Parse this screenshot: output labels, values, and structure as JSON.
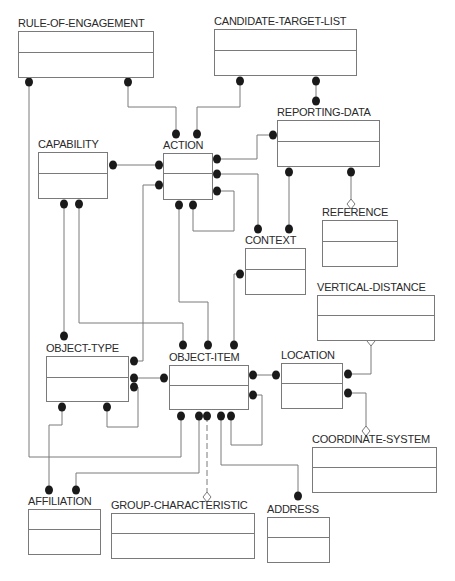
{
  "diagram": {
    "type": "IDEF1X entity-relationship diagram",
    "colors": {
      "line": "#7a7a7a",
      "dot": "#1a1a1a",
      "text": "#2a2a2a",
      "background": "#ffffff"
    }
  },
  "entities": [
    {
      "id": "rule-of-engagement",
      "name": "RULE-OF-ENGAGEMENT",
      "x": 18,
      "y": 31,
      "w": 136,
      "h": 47,
      "key_h": 21
    },
    {
      "id": "candidate-target-list",
      "name": "CANDIDATE-TARGET-LIST",
      "x": 214,
      "y": 29,
      "w": 143,
      "h": 47,
      "key_h": 21
    },
    {
      "id": "reporting-data",
      "name": "REPORTING-DATA",
      "x": 277,
      "y": 120,
      "w": 103,
      "h": 47,
      "key_h": 21
    },
    {
      "id": "capability",
      "name": "CAPABILITY",
      "x": 38,
      "y": 152,
      "w": 70,
      "h": 47,
      "key_h": 21
    },
    {
      "id": "action",
      "name": "ACTION",
      "x": 163,
      "y": 153,
      "w": 50,
      "h": 47,
      "key_h": 20
    },
    {
      "id": "reference",
      "name": "REFERENCE",
      "x": 322,
      "y": 220,
      "w": 76,
      "h": 47,
      "key_h": 21
    },
    {
      "id": "context",
      "name": "CONTEXT",
      "x": 245,
      "y": 248,
      "w": 61,
      "h": 47,
      "key_h": 21
    },
    {
      "id": "vertical-distance",
      "name": "VERTICAL-DISTANCE",
      "x": 317,
      "y": 295,
      "w": 118,
      "h": 46,
      "key_h": 20
    },
    {
      "id": "object-type",
      "name": "OBJECT-TYPE",
      "x": 46,
      "y": 356,
      "w": 83,
      "h": 46,
      "key_h": 21
    },
    {
      "id": "location",
      "name": "LOCATION",
      "x": 281,
      "y": 363,
      "w": 62,
      "h": 46,
      "key_h": 20
    },
    {
      "id": "object-item",
      "name": "OBJECT-ITEM",
      "x": 169,
      "y": 365,
      "w": 80,
      "h": 45,
      "key_h": 20
    },
    {
      "id": "coordinate-system",
      "name": "COORDINATE-SYSTEM",
      "x": 312,
      "y": 447,
      "w": 125,
      "h": 46,
      "key_h": 20
    },
    {
      "id": "affiliation",
      "name": "AFFILIATION",
      "x": 28,
      "y": 509,
      "w": 73,
      "h": 46,
      "key_h": 20
    },
    {
      "id": "group-characteristic",
      "name": "GROUP-CHARACTERISTIC",
      "x": 111,
      "y": 513,
      "w": 144,
      "h": 46,
      "key_h": 20
    },
    {
      "id": "address",
      "name": "ADDRESS",
      "x": 267,
      "y": 517,
      "w": 63,
      "h": 46,
      "key_h": 20
    }
  ],
  "relationships": [
    {
      "from": "rule-of-engagement",
      "to": "action",
      "type": "identifying",
      "points": [
        [
          128,
          82
        ],
        [
          128,
          107
        ],
        [
          176,
          107
        ],
        [
          176,
          134
        ]
      ]
    },
    {
      "from": "candidate-target-list",
      "to": "action",
      "type": "identifying",
      "points": [
        [
          240,
          81
        ],
        [
          240,
          107
        ],
        [
          197,
          107
        ],
        [
          197,
          134
        ]
      ]
    },
    {
      "from": "candidate-target-list",
      "to": "reporting-data",
      "type": "identifying",
      "points": [
        [
          316,
          81
        ],
        [
          316,
          101
        ]
      ]
    },
    {
      "from": "rule-of-engagement",
      "to": "object-item",
      "type": "identifying",
      "points": [
        [
          29,
          82
        ],
        [
          29,
          457
        ],
        [
          181,
          457
        ],
        [
          181,
          416
        ]
      ]
    },
    {
      "from": "capability",
      "to": "action",
      "type": "identifying",
      "points": [
        [
          113,
          165
        ],
        [
          159,
          165
        ]
      ]
    },
    {
      "from": "action",
      "to": "reporting-data",
      "type": "identifying",
      "points": [
        [
          217,
          159
        ],
        [
          257,
          159
        ],
        [
          257,
          135
        ],
        [
          273,
          135
        ]
      ]
    },
    {
      "from": "action",
      "to": "context",
      "type": "identifying",
      "points": [
        [
          217,
          174
        ],
        [
          258,
          174
        ],
        [
          258,
          229
        ]
      ]
    },
    {
      "from": "action",
      "to": "action",
      "type": "recursive",
      "points": [
        [
          217,
          191
        ],
        [
          234,
          191
        ],
        [
          234,
          231
        ],
        [
          193,
          231
        ],
        [
          193,
          205
        ]
      ]
    },
    {
      "from": "reporting-data",
      "to": "context",
      "type": "identifying",
      "points": [
        [
          289,
          172
        ],
        [
          289,
          229
        ]
      ]
    },
    {
      "from": "reporting-data",
      "to": "reference",
      "type": "categorization",
      "points": [
        [
          351,
          172
        ],
        [
          351,
          200
        ]
      ],
      "end": "diamond"
    },
    {
      "from": "capability",
      "to": "object-type",
      "type": "identifying",
      "points": [
        [
          64,
          204
        ],
        [
          64,
          336
        ]
      ]
    },
    {
      "from": "capability",
      "to": "object-item",
      "type": "identifying",
      "points": [
        [
          79,
          204
        ],
        [
          79,
          323
        ],
        [
          183,
          323
        ],
        [
          183,
          345
        ]
      ]
    },
    {
      "from": "action",
      "to": "object-type",
      "type": "identifying",
      "points": [
        [
          159,
          185
        ],
        [
          143,
          185
        ],
        [
          143,
          361
        ],
        [
          134,
          361
        ]
      ]
    },
    {
      "from": "action",
      "to": "object-item",
      "type": "identifying",
      "points": [
        [
          179,
          205
        ],
        [
          179,
          302
        ],
        [
          208,
          302
        ],
        [
          208,
          345
        ]
      ]
    },
    {
      "from": "context",
      "to": "object-item",
      "type": "identifying",
      "points": [
        [
          240,
          274
        ],
        [
          234,
          274
        ],
        [
          234,
          345
        ]
      ]
    },
    {
      "from": "object-type",
      "to": "object-item",
      "type": "identifying",
      "points": [
        [
          134,
          378
        ],
        [
          164,
          378
        ]
      ]
    },
    {
      "from": "object-type",
      "to": "object-type",
      "type": "recursive",
      "points": [
        [
          134,
          387
        ],
        [
          138,
          387
        ],
        [
          138,
          427
        ],
        [
          107,
          427
        ],
        [
          107,
          407
        ]
      ]
    },
    {
      "from": "object-type",
      "to": "affiliation",
      "type": "identifying",
      "points": [
        [
          62,
          407
        ],
        [
          62,
          425
        ],
        [
          49,
          425
        ],
        [
          49,
          490
        ]
      ]
    },
    {
      "from": "object-item",
      "to": "affiliation",
      "type": "identifying",
      "points": [
        [
          199,
          416
        ],
        [
          199,
          473
        ],
        [
          76,
          473
        ],
        [
          76,
          490
        ]
      ]
    },
    {
      "from": "object-item",
      "to": "location",
      "type": "identifying",
      "points": [
        [
          253,
          375
        ],
        [
          276,
          375
        ]
      ]
    },
    {
      "from": "object-item",
      "to": "object-item",
      "type": "recursive",
      "points": [
        [
          253,
          395
        ],
        [
          262,
          395
        ],
        [
          262,
          445
        ],
        [
          231,
          445
        ],
        [
          231,
          416
        ]
      ]
    },
    {
      "from": "object-item",
      "to": "group-characteristic",
      "type": "categorization",
      "points": [
        [
          207,
          416
        ],
        [
          207,
          493
        ]
      ],
      "end": "diamond",
      "dashed": true
    },
    {
      "from": "object-item",
      "to": "address",
      "type": "identifying",
      "points": [
        [
          221,
          416
        ],
        [
          221,
          465
        ],
        [
          298,
          465
        ],
        [
          298,
          496
        ]
      ]
    },
    {
      "from": "location",
      "to": "vertical-distance",
      "type": "categorization",
      "points": [
        [
          348,
          374
        ],
        [
          371,
          374
        ],
        [
          371,
          345
        ]
      ],
      "end": "diamond"
    },
    {
      "from": "location",
      "to": "coordinate-system",
      "type": "categorization",
      "points": [
        [
          348,
          393
        ],
        [
          366,
          393
        ],
        [
          366,
          427
        ]
      ],
      "end": "diamond"
    }
  ],
  "dots": [
    [
      29,
      82
    ],
    [
      128,
      82
    ],
    [
      240,
      81
    ],
    [
      316,
      81
    ],
    [
      316,
      101
    ],
    [
      176,
      134
    ],
    [
      197,
      134
    ],
    [
      113,
      165
    ],
    [
      159,
      165
    ],
    [
      159,
      185
    ],
    [
      217,
      159
    ],
    [
      217,
      174
    ],
    [
      217,
      191
    ],
    [
      179,
      205
    ],
    [
      193,
      205
    ],
    [
      273,
      135
    ],
    [
      64,
      204
    ],
    [
      79,
      204
    ],
    [
      289,
      172
    ],
    [
      351,
      172
    ],
    [
      258,
      229
    ],
    [
      289,
      229
    ],
    [
      240,
      274
    ],
    [
      64,
      336
    ],
    [
      183,
      345
    ],
    [
      208,
      345
    ],
    [
      234,
      345
    ],
    [
      134,
      361
    ],
    [
      134,
      378
    ],
    [
      134,
      387
    ],
    [
      164,
      378
    ],
    [
      62,
      407
    ],
    [
      107,
      407
    ],
    [
      253,
      375
    ],
    [
      276,
      375
    ],
    [
      253,
      395
    ],
    [
      348,
      374
    ],
    [
      348,
      393
    ],
    [
      181,
      416
    ],
    [
      199,
      416
    ],
    [
      207,
      416
    ],
    [
      221,
      416
    ],
    [
      231,
      416
    ],
    [
      49,
      490
    ],
    [
      76,
      490
    ],
    [
      298,
      496
    ]
  ]
}
